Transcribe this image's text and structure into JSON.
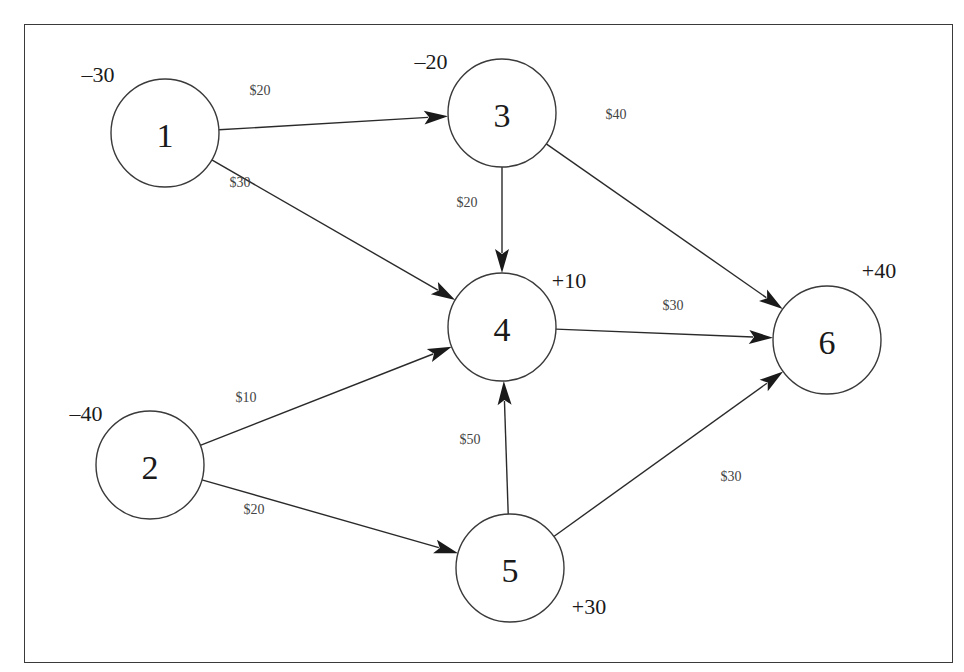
{
  "diagram": {
    "type": "network-flow",
    "colors": {
      "stroke": "#3a3a3a",
      "text": "#1a1a1a",
      "cost_text": "#444444",
      "background": "#ffffff"
    },
    "node_radius": 54,
    "nodes": [
      {
        "id": "1",
        "label": "1",
        "x": 165,
        "y": 133,
        "supply": "–30",
        "supply_x": 98,
        "supply_y": 74
      },
      {
        "id": "2",
        "label": "2",
        "x": 150,
        "y": 465,
        "supply": "–40",
        "supply_x": 86,
        "supply_y": 413
      },
      {
        "id": "3",
        "label": "3",
        "x": 502,
        "y": 113,
        "supply": "–20",
        "supply_x": 431,
        "supply_y": 61
      },
      {
        "id": "4",
        "label": "4",
        "x": 502,
        "y": 327,
        "supply": "+10",
        "supply_x": 569,
        "supply_y": 280
      },
      {
        "id": "5",
        "label": "5",
        "x": 510,
        "y": 568,
        "supply": "+30",
        "supply_x": 589,
        "supply_y": 606
      },
      {
        "id": "6",
        "label": "6",
        "x": 827,
        "y": 340,
        "supply": "+40",
        "supply_x": 879,
        "supply_y": 270
      }
    ],
    "edges": [
      {
        "from": "1",
        "to": "3",
        "cost": "$20",
        "label_x": 260,
        "label_y": 90
      },
      {
        "from": "1",
        "to": "4",
        "cost": "$30",
        "label_x": 240,
        "label_y": 182
      },
      {
        "from": "3",
        "to": "4",
        "cost": "$20",
        "label_x": 467,
        "label_y": 202
      },
      {
        "from": "3",
        "to": "6",
        "cost": "$40",
        "label_x": 616,
        "label_y": 114
      },
      {
        "from": "4",
        "to": "6",
        "cost": "$30",
        "label_x": 673,
        "label_y": 305
      },
      {
        "from": "2",
        "to": "4",
        "cost": "$10",
        "label_x": 246,
        "label_y": 397
      },
      {
        "from": "2",
        "to": "5",
        "cost": "$20",
        "label_x": 254,
        "label_y": 509
      },
      {
        "from": "5",
        "to": "4",
        "cost": "$50",
        "label_x": 470,
        "label_y": 439
      },
      {
        "from": "5",
        "to": "6",
        "cost": "$30",
        "label_x": 731,
        "label_y": 476
      }
    ]
  }
}
